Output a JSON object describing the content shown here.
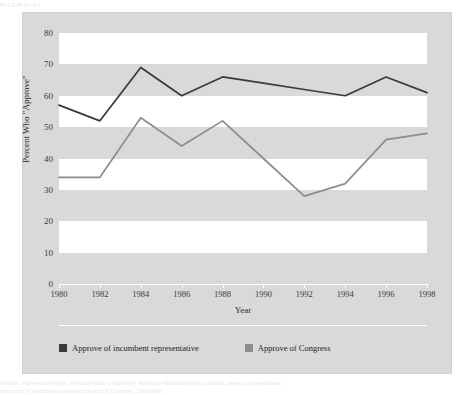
{
  "ghost_text": {
    "top": "pp   g     g           pp      g                      p    y p",
    "bottom_1": "Sources: Harvey and Wayne, Political Science Quarterly; American National Election Studies, percent of respondents",
    "bottom_2": "approving of incumbent representative and of Congress, 1980-1998."
  },
  "axes": {
    "ylabel": "Percent Who \"Approve\"",
    "xlabel": "Year",
    "yticks": [
      "80",
      "70",
      "60",
      "50",
      "40",
      "30",
      "20",
      "10",
      "0"
    ],
    "xticks": [
      "1980",
      "1982",
      "1984",
      "1986",
      "1988",
      "1990",
      "1992",
      "1994",
      "1996",
      "1998"
    ]
  },
  "legend": {
    "items": [
      {
        "label": "Approve of incumbent representative",
        "color": "#3a3a3a"
      },
      {
        "label": "Approve of Congress",
        "color": "#8d8d8d"
      }
    ]
  },
  "colors": {
    "panel": "#d9d9d9",
    "band": "#ffffff",
    "incumbent": "#3a3a3a",
    "congress": "#8d8d8d"
  },
  "chart_data": {
    "type": "line",
    "title": "",
    "xlabel": "Year",
    "ylabel": "Percent Who \"Approve\"",
    "x": [
      1980,
      1982,
      1984,
      1986,
      1988,
      1990,
      1992,
      1994,
      1996,
      1998
    ],
    "xlim": [
      1980,
      1998
    ],
    "ylim": [
      0,
      80
    ],
    "ytick_step": 10,
    "grid": "alternating-horizontal-bands",
    "legend_position": "bottom-left",
    "series": [
      {
        "name": "Approve of incumbent representative",
        "color": "#3a3a3a",
        "values": [
          57,
          52,
          69,
          60,
          66,
          64,
          62,
          60,
          66,
          61
        ]
      },
      {
        "name": "Approve of Congress",
        "color": "#8d8d8d",
        "values": [
          34,
          34,
          53,
          44,
          52,
          40,
          28,
          32,
          46,
          48
        ]
      }
    ]
  }
}
